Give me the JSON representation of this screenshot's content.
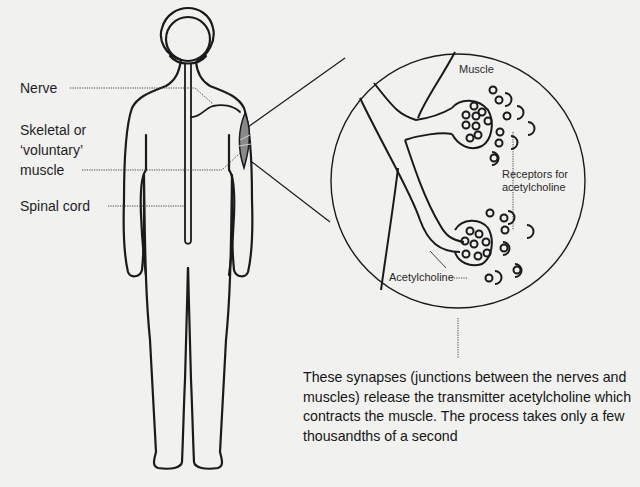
{
  "diagram": {
    "labels": {
      "nerve": "Nerve",
      "skeletal_muscle_line1": "Skeletal or",
      "skeletal_muscle_line2": "‘voluntary’",
      "skeletal_muscle_line3": "muscle",
      "spinal_cord": "Spinal cord",
      "muscle": "Muscle",
      "receptors_line1": "Receptors for",
      "receptors_line2": "acetylcholine",
      "acetylcholine": "Acetylcholine"
    },
    "caption": "These synapses (junctions between the nerves and muscles) release the transmitter acetylcholine which contracts the muscle. The process takes only a few thousandths of a second",
    "colors": {
      "background": "#f1f1ef",
      "line": "#1a1a1a",
      "muscle_fill": "#8a8a8a"
    }
  }
}
